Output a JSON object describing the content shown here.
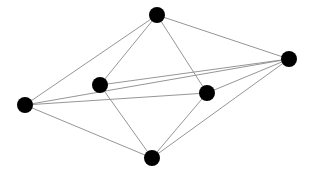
{
  "figure": {
    "width": 312,
    "height": 178,
    "background_color": "#ffffff"
  },
  "style": {
    "node_color": "#000000",
    "node_radius": 8,
    "edge_color": "#8a8a8a",
    "edge_width": 0.9
  },
  "chart_data": {
    "type": "diagram",
    "subtype": "node-link-graph",
    "directed": false,
    "weighted": false,
    "node_count": 6,
    "edge_count": 11,
    "nodes": [
      {
        "id": "top",
        "label": "",
        "x": 157,
        "y": 15,
        "degree": 4
      },
      {
        "id": "right",
        "label": "",
        "x": 289,
        "y": 59,
        "degree": 5
      },
      {
        "id": "middle-left",
        "label": "",
        "x": 100,
        "y": 85,
        "degree": 3
      },
      {
        "id": "middle-right",
        "label": "",
        "x": 207,
        "y": 93,
        "degree": 4
      },
      {
        "id": "left",
        "label": "",
        "x": 25,
        "y": 105,
        "degree": 4
      },
      {
        "id": "bottom",
        "label": "",
        "x": 152,
        "y": 158,
        "degree": 4
      }
    ],
    "edges": [
      {
        "source": "left",
        "target": "top"
      },
      {
        "source": "left",
        "target": "right"
      },
      {
        "source": "left",
        "target": "middle-right"
      },
      {
        "source": "left",
        "target": "bottom"
      },
      {
        "source": "top",
        "target": "middle-left"
      },
      {
        "source": "top",
        "target": "middle-right"
      },
      {
        "source": "top",
        "target": "right"
      },
      {
        "source": "middle-left",
        "target": "right"
      },
      {
        "source": "middle-left",
        "target": "bottom"
      },
      {
        "source": "middle-right",
        "target": "right"
      },
      {
        "source": "middle-right",
        "target": "bottom"
      },
      {
        "source": "bottom",
        "target": "right"
      }
    ],
    "title": "",
    "legend": []
  }
}
